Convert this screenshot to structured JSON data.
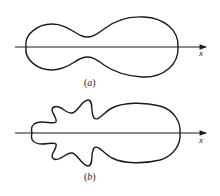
{
  "figure": {
    "panels": [
      {
        "id": "a",
        "caption_open": "(",
        "caption_letter": "a",
        "caption_close": ")",
        "axis_label": "x",
        "description": "Two-lobed radiation pattern: smaller rear lobe and larger forward lobe along x-axis"
      },
      {
        "id": "b",
        "caption_open": "(",
        "caption_letter": "b",
        "caption_close": ")",
        "axis_label": "x",
        "description": "Radiation pattern with large forward lobe and several side lobes (petals) plus small rear lobe along x-axis"
      }
    ],
    "colors": {
      "stroke": "#1a1a1a",
      "background": "#ffffff"
    }
  }
}
